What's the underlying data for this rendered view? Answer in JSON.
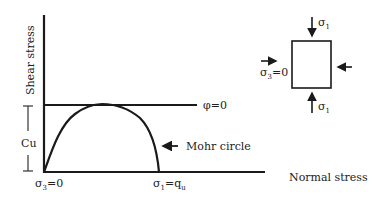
{
  "diagram": {
    "axes": {
      "y_label": "Shear stress",
      "x_label": "Normal stress"
    },
    "failure_envelope": {
      "label": "φ=0"
    },
    "mohr_circle": {
      "label": "Mohr circle"
    },
    "cohesion": {
      "label": "Cu"
    },
    "origin_label": {
      "sym": "σ",
      "sub": "3",
      "rest": "=0"
    },
    "sigma1_label": {
      "sym": "σ",
      "sub": "1",
      "eq": "=q",
      "sub2": "u"
    },
    "element": {
      "top_label": {
        "sym": "σ",
        "sub": "1"
      },
      "bottom_label": {
        "sym": "σ",
        "sub": "1"
      },
      "left_label": {
        "sym": "σ",
        "sub": "3",
        "rest": "=0"
      }
    },
    "colors": {
      "line": "#1a1a1a",
      "text": "#222222",
      "background": "#ffffff"
    }
  }
}
